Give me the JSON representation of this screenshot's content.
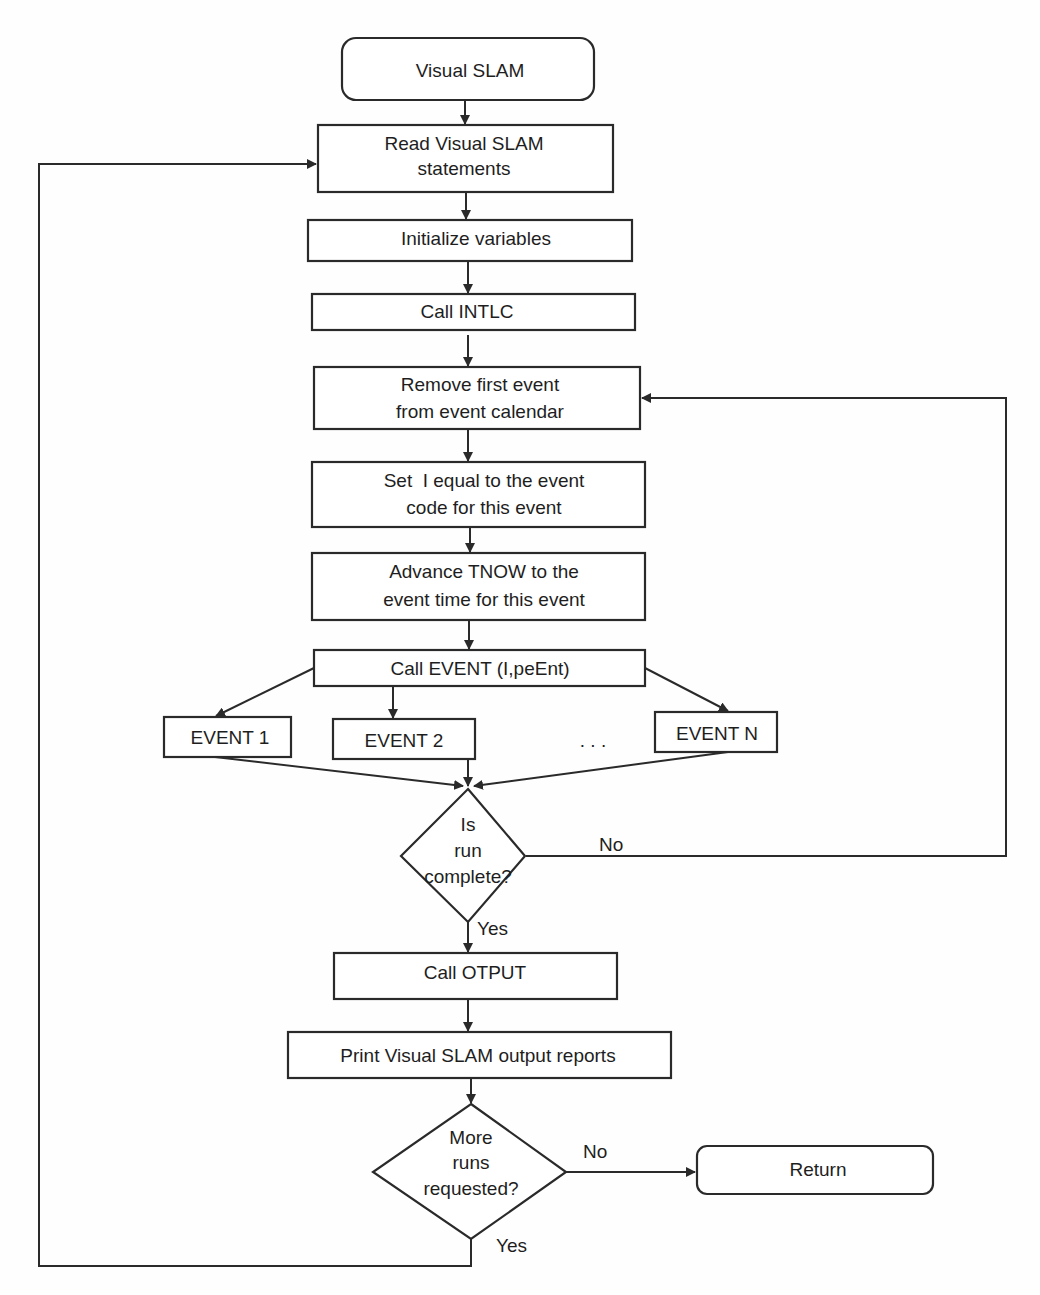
{
  "diagram": {
    "type": "flowchart",
    "title": "Visual SLAM",
    "nodes": {
      "start": {
        "label": "Visual SLAM",
        "shape": "terminator"
      },
      "read": {
        "lines": [
          "Read Visual SLAM",
          "statements"
        ],
        "shape": "process"
      },
      "init": {
        "label": "Initialize variables",
        "shape": "process"
      },
      "intlc": {
        "label": "Call INTLC",
        "shape": "process"
      },
      "remove": {
        "lines": [
          "Remove first event",
          "from event calendar"
        ],
        "shape": "process"
      },
      "setI": {
        "lines": [
          "Set  I equal to the event",
          "code for this event"
        ],
        "shape": "process"
      },
      "advance": {
        "lines": [
          "Advance TNOW to the",
          "event time for this event"
        ],
        "shape": "process"
      },
      "callEvent": {
        "label": "Call EVENT (I,peEnt)",
        "shape": "process"
      },
      "event1": {
        "label": "EVENT 1",
        "shape": "process"
      },
      "event2": {
        "label": "EVENT 2",
        "shape": "process"
      },
      "ellipsis": {
        "label": ". . ."
      },
      "eventN": {
        "label": "EVENT N",
        "shape": "process"
      },
      "runComplete": {
        "lines": [
          "Is",
          "run",
          "complete?"
        ],
        "shape": "decision"
      },
      "otput": {
        "label": "Call OTPUT",
        "shape": "process"
      },
      "print": {
        "label": "Print Visual SLAM output reports",
        "shape": "process"
      },
      "moreRuns": {
        "lines": [
          "More",
          "runs",
          "requested?"
        ],
        "shape": "decision"
      },
      "return": {
        "label": "Return",
        "shape": "terminator"
      }
    },
    "edge_labels": {
      "run_no": "No",
      "run_yes": "Yes",
      "more_no": "No",
      "more_yes": "Yes"
    },
    "edges": [
      {
        "from": "start",
        "to": "read"
      },
      {
        "from": "read",
        "to": "init"
      },
      {
        "from": "init",
        "to": "intlc"
      },
      {
        "from": "intlc",
        "to": "remove"
      },
      {
        "from": "remove",
        "to": "setI"
      },
      {
        "from": "setI",
        "to": "advance"
      },
      {
        "from": "advance",
        "to": "callEvent"
      },
      {
        "from": "callEvent",
        "to": "event1"
      },
      {
        "from": "callEvent",
        "to": "event2"
      },
      {
        "from": "callEvent",
        "to": "eventN"
      },
      {
        "from": "event1",
        "to": "runComplete"
      },
      {
        "from": "event2",
        "to": "runComplete"
      },
      {
        "from": "eventN",
        "to": "runComplete"
      },
      {
        "from": "runComplete",
        "to": "remove",
        "label": "No"
      },
      {
        "from": "runComplete",
        "to": "otput",
        "label": "Yes"
      },
      {
        "from": "otput",
        "to": "print"
      },
      {
        "from": "print",
        "to": "moreRuns"
      },
      {
        "from": "moreRuns",
        "to": "return",
        "label": "No"
      },
      {
        "from": "moreRuns",
        "to": "read",
        "label": "Yes"
      }
    ],
    "colors": {
      "stroke": "#2a2a2a",
      "text": "#1e1e1e",
      "background": "#fefefe"
    }
  }
}
